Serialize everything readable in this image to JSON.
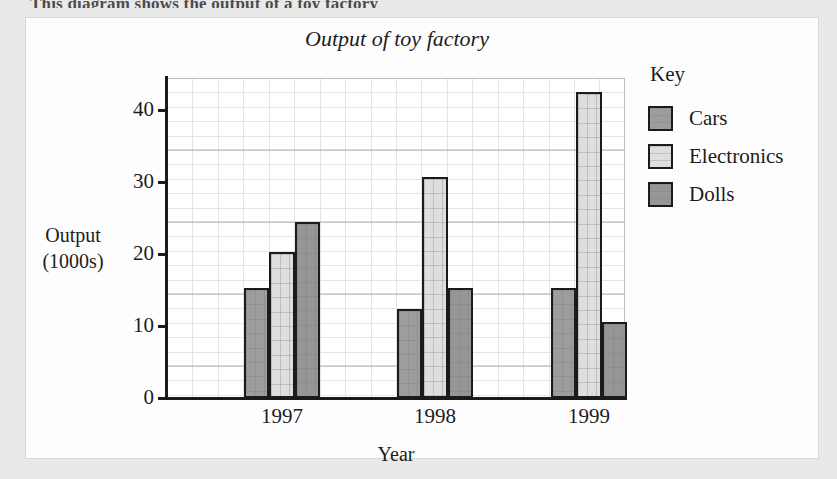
{
  "page": {
    "cropped_caption_text": "This diagram shows the output of a toy factory"
  },
  "legend": {
    "title": "Key",
    "items": [
      {
        "label": "Cars",
        "color": "#9d9d9d"
      },
      {
        "label": "Electronics",
        "color": "#dedede"
      },
      {
        "label": "Dolls",
        "color": "#969696"
      }
    ]
  },
  "axis": {
    "y_title_line1": "Output",
    "y_title_line2": "(1000s)",
    "x_title": "Year",
    "y_ticks": [
      "0",
      "10",
      "20",
      "30",
      "40"
    ]
  },
  "chart_data": {
    "type": "bar",
    "title": "Output of toy factory",
    "xlabel": "Year",
    "ylabel": "Output (1000s)",
    "categories": [
      "1997",
      "1998",
      "1999"
    ],
    "series": [
      {
        "name": "Cars",
        "color": "#9d9d9d",
        "values": [
          15.2,
          12.3,
          15.3
        ]
      },
      {
        "name": "Electronics",
        "color": "#dedede",
        "values": [
          20.3,
          30.6,
          42.5
        ]
      },
      {
        "name": "Dolls",
        "color": "#969696",
        "values": [
          24.4,
          15.2,
          10.5
        ]
      }
    ],
    "ylim": [
      0,
      44.4
    ],
    "ytick_values": [
      0,
      10,
      20,
      30,
      40
    ],
    "grid": true,
    "grid_minor_step": 2,
    "legend_position": "right",
    "legend_title": "Key"
  }
}
